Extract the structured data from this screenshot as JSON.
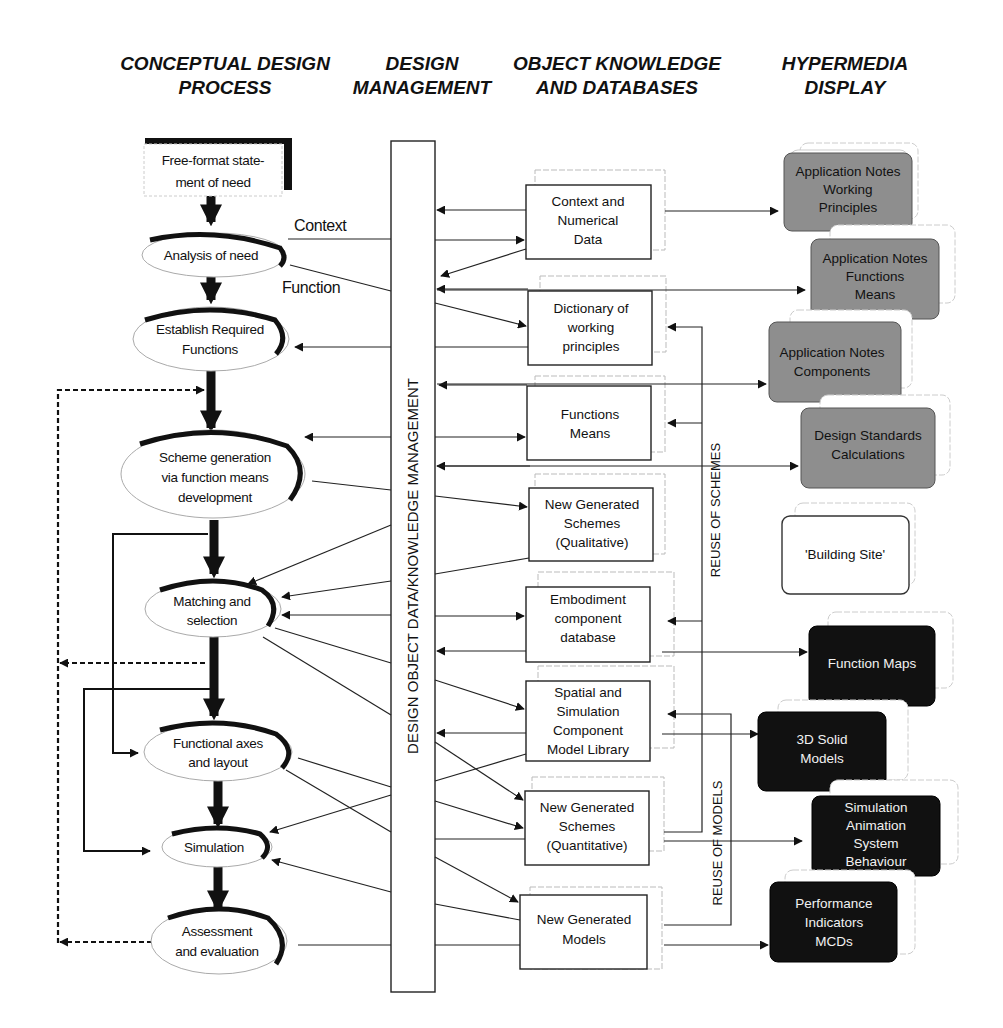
{
  "headers": {
    "col1": [
      "CONCEPTUAL DESIGN",
      "PROCESS"
    ],
    "col2": [
      "DESIGN",
      "MANAGEMENT"
    ],
    "col3": [
      "OBJECT KNOWLEDGE",
      "AND DATABASES"
    ],
    "col4": [
      "HYPERMEDIA",
      "DISPLAY"
    ]
  },
  "process": {
    "start": [
      "Free-format state-",
      "ment of need"
    ],
    "steps": [
      {
        "id": "analysis",
        "lines": [
          "Analysis of need"
        ]
      },
      {
        "id": "establish",
        "lines": [
          "Establish Required",
          "Functions"
        ]
      },
      {
        "id": "scheme",
        "lines": [
          "Scheme generation",
          "via function means",
          "development"
        ]
      },
      {
        "id": "matching",
        "lines": [
          "Matching and",
          "selection"
        ]
      },
      {
        "id": "functional",
        "lines": [
          "Functional axes",
          "and layout"
        ]
      },
      {
        "id": "simulation",
        "lines": [
          "Simulation"
        ]
      },
      {
        "id": "assessment",
        "lines": [
          "Assessment",
          "and evaluation"
        ]
      }
    ],
    "edge_labels": {
      "context": "Context",
      "function": "Function"
    }
  },
  "management": {
    "bar_label": "DESIGN OBJECT DATA/KNOWLEDGE MANAGEMENT"
  },
  "databases": [
    {
      "id": "context-data",
      "lines": [
        "Context and",
        "Numerical",
        "Data"
      ]
    },
    {
      "id": "dictionary",
      "lines": [
        "Dictionary of",
        "working",
        "principles"
      ]
    },
    {
      "id": "functions-means",
      "lines": [
        "Functions",
        "Means"
      ]
    },
    {
      "id": "schemes-qual",
      "lines": [
        "New Generated",
        "Schemes",
        "(Qualitative)"
      ]
    },
    {
      "id": "embodiment",
      "lines": [
        "Embodiment",
        "component",
        "database"
      ]
    },
    {
      "id": "spatial",
      "lines": [
        "Spatial and",
        "Simulation",
        "Component",
        "Model Library"
      ]
    },
    {
      "id": "schemes-quant",
      "lines": [
        "New Generated",
        "Schemes",
        "(Quantitative)"
      ]
    },
    {
      "id": "models",
      "lines": [
        "New Generated",
        "Models"
      ]
    }
  ],
  "reuse_labels": {
    "schemes": "REUSE OF SCHEMES",
    "models": "REUSE OF MODELS"
  },
  "hypermedia": [
    {
      "id": "notes-working",
      "style": "grey",
      "lines": [
        "Application Notes",
        "Working",
        "Principles"
      ]
    },
    {
      "id": "notes-functions",
      "style": "grey",
      "lines": [
        "Application Notes",
        "Functions",
        "Means"
      ]
    },
    {
      "id": "notes-components",
      "style": "grey",
      "lines": [
        "Application Notes",
        "Components"
      ]
    },
    {
      "id": "design-standards",
      "style": "grey",
      "lines": [
        "Design Standards",
        "Calculations"
      ]
    },
    {
      "id": "building-site",
      "style": "white",
      "lines": [
        "'Building Site'"
      ]
    },
    {
      "id": "function-maps",
      "style": "dark",
      "lines": [
        "Function Maps"
      ]
    },
    {
      "id": "solid-models",
      "style": "dark",
      "lines": [
        "3D Solid",
        "Models"
      ]
    },
    {
      "id": "sim-animation",
      "style": "dark",
      "lines": [
        "Simulation",
        "Animation",
        "System",
        "Behaviour"
      ]
    },
    {
      "id": "performance",
      "style": "dark",
      "lines": [
        "Performance",
        "Indicators",
        "MCDs"
      ]
    }
  ],
  "colors": {
    "grey_box": "#8e8e8e",
    "dark_box": "#111111",
    "line": "#222222"
  }
}
